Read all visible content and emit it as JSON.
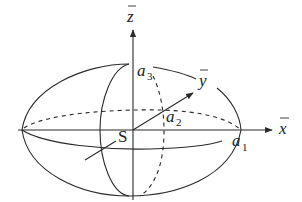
{
  "diagram": {
    "labels": {
      "z_axis": "z",
      "y_axis": "y",
      "x_axis": "x",
      "center": "S",
      "a1": "a",
      "a1_sub": "1",
      "a2": "a",
      "a2_sub": "2",
      "a3": "a",
      "a3_sub": "3"
    },
    "colors": {
      "stroke": "#2a2a2a",
      "background": "#ffffff"
    }
  }
}
